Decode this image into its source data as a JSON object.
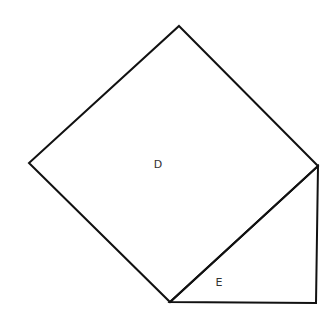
{
  "diagram": {
    "stroke_color": "#111111",
    "shapes": [
      {
        "id": "square-D",
        "type": "square",
        "label": "D",
        "vertices": [
          [
            179,
            26
          ],
          [
            318,
            166
          ],
          [
            170,
            302
          ],
          [
            29,
            163
          ]
        ],
        "label_pos": [
          158,
          168
        ]
      },
      {
        "id": "triangle-E",
        "type": "right-triangle",
        "label": "E",
        "vertices": [
          [
            170,
            302
          ],
          [
            318,
            166
          ],
          [
            316,
            303
          ]
        ],
        "label_pos": [
          219,
          286
        ]
      }
    ]
  }
}
